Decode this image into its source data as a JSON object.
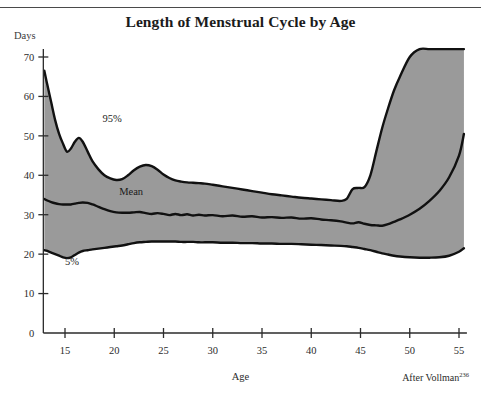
{
  "page": {
    "header_cut_text": "",
    "title": "Length of Menstrual Cycle by Age",
    "y_unit_label": "Days",
    "x_caption": "Age",
    "source_prefix": "After Vollman",
    "source_citation": "236"
  },
  "labels": {
    "upper_band": "95%",
    "mean_line": "Mean",
    "lower_band": "5%"
  },
  "colors": {
    "band_fill": "#9a9a9a",
    "curve_stroke": "#111111",
    "axis": "#2b2b2b",
    "page_background": "#ffffff",
    "title_color": "#1b1b1b"
  },
  "chart_data": {
    "type": "area",
    "title": "Length of Menstrual Cycle by Age",
    "xlabel": "Age",
    "ylabel": "Days",
    "xlim": [
      12.8,
      55.6
    ],
    "ylim": [
      0,
      72
    ],
    "xticks": [
      15,
      20,
      25,
      30,
      35,
      40,
      45,
      50,
      55
    ],
    "yticks": [
      0,
      10,
      20,
      30,
      40,
      50,
      60,
      70
    ],
    "grid": false,
    "legend": "inline annotations",
    "annotations": [
      {
        "text": "95%",
        "x": 18.8,
        "y": 53.5
      },
      {
        "text": "Mean",
        "x": 20.5,
        "y": 35.0
      },
      {
        "text": "5%",
        "x": 15.0,
        "y": 17.3
      }
    ],
    "x": [
      12.9,
      13.2,
      13.6,
      14.0,
      14.4,
      14.8,
      15.2,
      15.6,
      16.0,
      16.4,
      16.8,
      17.3,
      17.8,
      18.4,
      19.0,
      19.6,
      20.2,
      20.8,
      21.4,
      22.0,
      22.6,
      23.2,
      23.8,
      24.4,
      25.0,
      25.6,
      26.2,
      26.8,
      27.4,
      28.0,
      28.6,
      29.2,
      30.0,
      31.0,
      32.0,
      33.0,
      34.0,
      35.0,
      36.0,
      37.0,
      38.0,
      39.0,
      40.0,
      41.0,
      42.0,
      43.0,
      43.6,
      44.2,
      44.8,
      45.4,
      46.0,
      46.6,
      47.2,
      47.8,
      48.4,
      49.0,
      50.0,
      51.0,
      52.0,
      53.0,
      54.0,
      55.0,
      55.5
    ],
    "series": [
      {
        "name": "95%",
        "values": [
          66.5,
          63.0,
          58.5,
          54.0,
          50.5,
          48.0,
          46.0,
          46.8,
          48.5,
          49.5,
          48.5,
          46.0,
          43.5,
          41.5,
          40.0,
          39.2,
          38.8,
          39.0,
          40.0,
          41.3,
          42.2,
          42.6,
          42.3,
          41.4,
          40.2,
          39.3,
          38.7,
          38.4,
          38.2,
          38.1,
          38.0,
          37.9,
          37.6,
          37.2,
          36.8,
          36.4,
          36.0,
          35.6,
          35.2,
          34.9,
          34.6,
          34.3,
          34.1,
          33.9,
          33.7,
          33.5,
          34.0,
          36.5,
          36.8,
          37.0,
          40.0,
          46.0,
          52.0,
          57.0,
          61.5,
          65.0,
          70.0,
          72.0,
          72.0,
          72.0,
          72.0,
          72.0,
          72.0
        ]
      },
      {
        "name": "Mean",
        "values": [
          34.0,
          33.6,
          33.2,
          32.9,
          32.7,
          32.6,
          32.6,
          32.6,
          32.8,
          33.0,
          33.1,
          33.0,
          32.6,
          32.0,
          31.4,
          30.9,
          30.6,
          30.5,
          30.5,
          30.6,
          30.7,
          30.4,
          30.2,
          30.4,
          30.2,
          29.9,
          30.2,
          29.9,
          30.1,
          29.8,
          30.0,
          29.8,
          29.9,
          29.6,
          29.8,
          29.5,
          29.6,
          29.3,
          29.4,
          29.2,
          29.3,
          29.0,
          29.1,
          28.8,
          28.6,
          28.3,
          28.0,
          27.8,
          28.1,
          27.7,
          27.4,
          27.3,
          27.2,
          27.6,
          28.2,
          28.8,
          30.0,
          31.5,
          33.5,
          36.0,
          39.5,
          45.0,
          50.5
        ]
      },
      {
        "name": "5%",
        "values": [
          21.0,
          20.8,
          20.4,
          20.0,
          19.6,
          19.2,
          19.0,
          19.2,
          19.8,
          20.4,
          20.8,
          21.0,
          21.2,
          21.4,
          21.6,
          21.8,
          22.0,
          22.2,
          22.5,
          22.8,
          23.0,
          23.1,
          23.2,
          23.2,
          23.2,
          23.2,
          23.2,
          23.1,
          23.1,
          23.1,
          23.0,
          23.0,
          23.0,
          22.9,
          22.9,
          22.8,
          22.8,
          22.7,
          22.7,
          22.6,
          22.6,
          22.5,
          22.4,
          22.3,
          22.2,
          22.1,
          22.0,
          21.8,
          21.6,
          21.3,
          21.0,
          20.6,
          20.2,
          19.9,
          19.6,
          19.4,
          19.2,
          19.1,
          19.1,
          19.2,
          19.6,
          20.6,
          21.5
        ]
      }
    ]
  }
}
